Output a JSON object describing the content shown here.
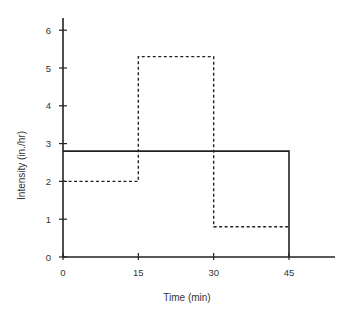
{
  "chart_data": {
    "type": "line",
    "subtype": "step",
    "title": "",
    "xlabel": "Time (min)",
    "ylabel": "Intensity (in./hr)",
    "xlim": [
      0,
      55
    ],
    "ylim": [
      0,
      6.3
    ],
    "x_ticks": [
      0,
      15,
      30,
      45
    ],
    "y_ticks": [
      0,
      1,
      2,
      3,
      4,
      5,
      6
    ],
    "grid": false,
    "legend": null,
    "series": [
      {
        "name": "solid",
        "style": "solid",
        "segments": [
          {
            "x_start": 0,
            "x_end": 45,
            "value": 2.8
          }
        ],
        "drop_to_zero_at": 45
      },
      {
        "name": "dashed",
        "style": "dashed",
        "segments": [
          {
            "x_start": 0,
            "x_end": 15,
            "value": 2.0
          },
          {
            "x_start": 15,
            "x_end": 30,
            "value": 5.3
          },
          {
            "x_start": 30,
            "x_end": 45,
            "value": 0.8
          }
        ]
      }
    ]
  }
}
